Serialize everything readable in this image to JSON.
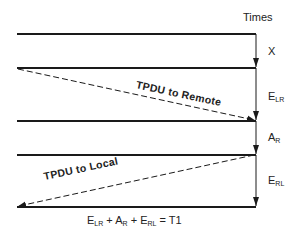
{
  "header": {
    "times_label": "Times"
  },
  "intervals": [
    {
      "id": "x",
      "main": "X",
      "sub": ""
    },
    {
      "id": "elr",
      "main": "E",
      "sub": "LR"
    },
    {
      "id": "ar",
      "main": "A",
      "sub": "R"
    },
    {
      "id": "erl",
      "main": "E",
      "sub": "RL"
    }
  ],
  "messages": {
    "to_remote": "TPDU to Remote",
    "to_local": "TPDU to Local"
  },
  "formula": {
    "t1_main": "E",
    "t1_sub": "LR",
    "plus1": " + ",
    "t2_main": "A",
    "t2_sub": "R",
    "plus2": " + ",
    "t3_main": "E",
    "t3_sub": "RL",
    "equals": " = T1"
  },
  "colors": {
    "line": "#1a1a1a",
    "background": "#ffffff"
  }
}
